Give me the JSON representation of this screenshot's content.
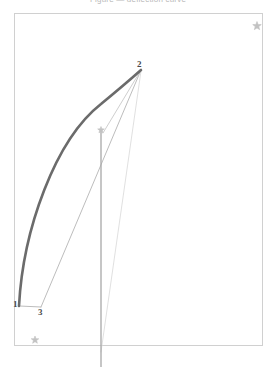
{
  "figure": {
    "title": "Figure — deflection curve",
    "frame": {
      "x": 14,
      "y": 13,
      "width": 248,
      "height": 332,
      "stroke": "#d0d0d0"
    },
    "canvas": {
      "width": 276,
      "height": 367,
      "background": "#ffffff"
    }
  },
  "colors": {
    "thick_curve": "#6b6b6b",
    "thin_line": "#bdbdbd",
    "faint_line": "#d6d6d6",
    "vertical_line": "#a8a8a8",
    "frame": "#d0d0d0",
    "star": "#c2c2c2",
    "label": "#4a4a4a"
  },
  "points": [
    {
      "id": "1",
      "label": "1",
      "x": 19,
      "y": 306,
      "label_x": 13,
      "label_y": 300
    },
    {
      "id": "2",
      "label": "2",
      "x": 141,
      "y": 70,
      "label_x": 137,
      "label_y": 60
    },
    {
      "id": "3",
      "label": "3",
      "x": 41,
      "y": 307,
      "label_x": 38,
      "label_y": 308
    }
  ],
  "curves": {
    "deflected_beam": {
      "name": "deflected-beam-curve",
      "path": "M 19 306 C 23 230 55 140 101 104 C 118 90 132 78 141 70",
      "stroke": "#6b6b6b",
      "stroke_width": 2.6
    },
    "chord_3_to_2": {
      "name": "chord-line-3-2",
      "path": "M 41 307 L 141 70",
      "stroke": "#bdbdbd",
      "stroke_width": 1.0
    },
    "chord_vertical_to_2": {
      "name": "chord-line-star-2",
      "path": "M 103 133 L 141 70",
      "stroke": "#cfcfcf",
      "stroke_width": 1.0
    },
    "chord_long_faint": {
      "name": "faint-chord-line",
      "path": "M 101 352 L 141 71",
      "stroke": "#dcdcdc",
      "stroke_width": 0.9
    },
    "base_segment": {
      "name": "base-segment-1-3",
      "path": "M 19 306 L 41 307",
      "stroke": "#bdbdbd",
      "stroke_width": 1.0
    },
    "vertical_axis": {
      "name": "vertical-reference-line",
      "path": "M 101 131 L 101 367",
      "stroke": "#a8a8a8",
      "stroke_width": 1.3
    }
  },
  "markers": [
    {
      "id": "star-top-right",
      "name": "star-marker-top-right",
      "x": 257,
      "y": 26,
      "size": 9
    },
    {
      "id": "star-mid-curve",
      "name": "star-marker-mid-curve",
      "x": 101,
      "y": 130,
      "size": 7
    },
    {
      "id": "star-bottom-left",
      "name": "star-marker-bottom-left",
      "x": 35,
      "y": 340,
      "size": 8
    }
  ],
  "chart_data": {
    "type": "line",
    "title": "Figure — deflection curve",
    "xlabel": "",
    "ylabel": "",
    "grid": false,
    "legend": "none",
    "annotations": [
      "1",
      "2",
      "3"
    ],
    "series": [
      {
        "name": "deflected-beam-curve",
        "style": "thick",
        "x": [
          19,
          28,
          42,
          60,
          80,
          101,
          120,
          133,
          141
        ],
        "y": [
          306,
          258,
          206,
          165,
          131,
          104,
          86,
          76,
          70
        ]
      },
      {
        "name": "chord-line-3-2",
        "style": "thin",
        "x": [
          41,
          141
        ],
        "y": [
          307,
          70
        ]
      },
      {
        "name": "base-segment-1-3",
        "style": "thin",
        "x": [
          19,
          41
        ],
        "y": [
          306,
          307
        ]
      },
      {
        "name": "vertical-reference-line",
        "style": "medium",
        "x": [
          101,
          101
        ],
        "y": [
          131,
          367
        ]
      }
    ]
  }
}
